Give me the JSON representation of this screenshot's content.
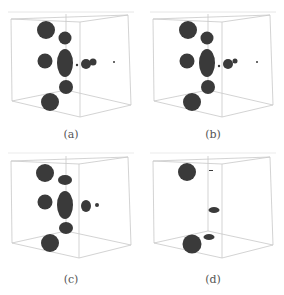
{
  "figure": {
    "panels": [
      {
        "id": "a",
        "caption": "(a)"
      },
      {
        "id": "b",
        "caption": "(b)"
      },
      {
        "id": "c",
        "caption": "(c)"
      },
      {
        "id": "d",
        "caption": "(d)"
      }
    ]
  },
  "colors": {
    "blob": "#3a3a3a",
    "box_line": "#c8c8c8",
    "caption": "#555555"
  }
}
